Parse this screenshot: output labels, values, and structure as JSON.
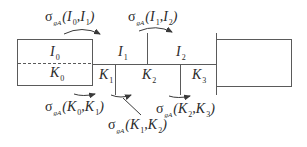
{
  "diagram": {
    "type": "layered-block-transition",
    "colors": {
      "line": "#5a5a5a",
      "text": "#2a2a2a",
      "background": "#ffffff"
    },
    "regions": {
      "left_block": {
        "upper_label": "I",
        "upper_index": "0",
        "lower_label": "K",
        "lower_index": "0",
        "divider": "dashed"
      },
      "segments_upper": [
        {
          "label": "I",
          "index": "1"
        },
        {
          "label": "I",
          "index": "2"
        }
      ],
      "segments_lower": [
        {
          "label": "K",
          "index": "1"
        },
        {
          "label": "K",
          "index": "2"
        },
        {
          "label": "K",
          "index": "3"
        }
      ],
      "right_block": {
        "label": ""
      }
    },
    "transitions": [
      {
        "id": "s_I0_I1",
        "sigma": "σ",
        "sub": "gA",
        "args": "(I",
        "a_idx": "0",
        "mid": ",I",
        "b_idx": "1",
        "close": ")"
      },
      {
        "id": "s_I1_I2",
        "sigma": "σ",
        "sub": "gA",
        "args": "(I",
        "a_idx": "1",
        "mid": ",I",
        "b_idx": "2",
        "close": ")"
      },
      {
        "id": "s_K0_K1",
        "sigma": "σ",
        "sub": "gA",
        "args": "(K",
        "a_idx": "0",
        "mid": ",K",
        "b_idx": "1",
        "close": ")"
      },
      {
        "id": "s_K1_K2",
        "sigma": "σ",
        "sub": "gA",
        "args": "(K",
        "a_idx": "1",
        "mid": ",K",
        "b_idx": "2",
        "close": ")"
      },
      {
        "id": "s_K2_K3",
        "sigma": "σ",
        "sub": "gA",
        "args": "(K",
        "a_idx": "2",
        "mid": ",K",
        "b_idx": "3",
        "close": ")"
      }
    ]
  }
}
